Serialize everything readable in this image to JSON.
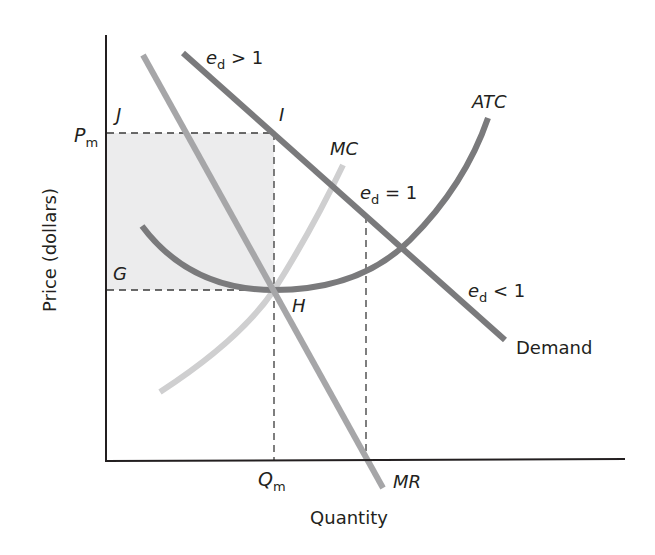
{
  "diagram": {
    "axes": {
      "y_label": "Price (dollars)",
      "x_label": "Quantity"
    },
    "price_label": {
      "main": "P",
      "sub": "m"
    },
    "quantity_label": {
      "main": "Q",
      "sub": "m"
    },
    "points": {
      "J": "J",
      "I": "I",
      "G": "G",
      "H": "H"
    },
    "curves": {
      "demand": {
        "label": "Demand",
        "color": "#7a7a7c"
      },
      "mr": {
        "label": "MR",
        "color": "#a6a6a8"
      },
      "mc": {
        "label": "MC",
        "color": "#cfcfd0"
      },
      "atc": {
        "label": "ATC",
        "color": "#7a7a7c"
      }
    },
    "elasticity": {
      "elastic": {
        "e": "e",
        "sub": "d",
        "rel": " > 1"
      },
      "unit": {
        "e": "e",
        "sub": "d",
        "rel": " = 1"
      },
      "inelastic": {
        "e": "e",
        "sub": "d",
        "rel": " < 1"
      }
    },
    "colors": {
      "axis": "#231f20",
      "profit_area": "#ececed",
      "dashed": "#3a3a3a"
    }
  }
}
